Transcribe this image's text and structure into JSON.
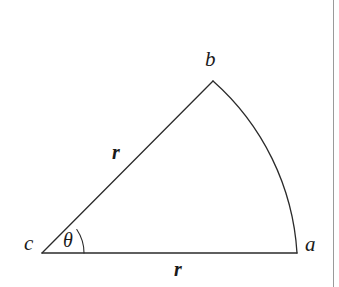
{
  "figure": {
    "type": "geometry-diagram",
    "background_color": "#ffffff",
    "stroke_color": "#2b2b2b",
    "stroke_width": 1.3,
    "page_edge_color": "#9a9a9a"
  },
  "labels": {
    "vertex_c": "c",
    "vertex_a": "a",
    "vertex_b": "b",
    "radius_slant": "r",
    "radius_base": "r",
    "angle_theta": "θ"
  },
  "geometry": {
    "center": {
      "x": 42,
      "y": 253,
      "name": "c"
    },
    "point_a": {
      "x": 297,
      "y": 253,
      "name": "a"
    },
    "point_b": {
      "x": 213,
      "y": 81,
      "name": "b"
    },
    "radius_px": 255,
    "angle_degrees": 34,
    "angle_arc_radius_px": 42,
    "arc_sweep": "b-to-a",
    "paths": {
      "base_line": "M 42 253 L 297 253",
      "slant_line": "M 42 253 L 213 81",
      "outer_arc": "M 213 81 A 250 250 0 0 1 297 253",
      "angle_arc": "M 84 253 A 42 42 0 0 0 76.8 229.5"
    }
  }
}
